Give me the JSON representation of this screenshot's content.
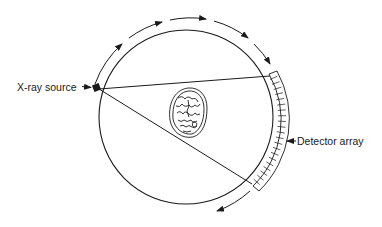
{
  "diagram": {
    "type": "CT scanner geometry (fan-beam)",
    "labels": {
      "source": "X-ray source",
      "detector": "Detector array"
    },
    "components": [
      {
        "id": "gantry-circle",
        "description": "circular scan field / gantry"
      },
      {
        "id": "xray-source",
        "description": "X-ray source on gantry, left"
      },
      {
        "id": "detector-array",
        "description": "curved segmented detector array, right"
      },
      {
        "id": "fan-beam",
        "description": "two lines from source to detector ends"
      },
      {
        "id": "patient-head",
        "description": "cross-section of head at center"
      },
      {
        "id": "rotation-arrows",
        "description": "clockwise rotation arrows around gantry"
      }
    ],
    "rotation_direction": "clockwise",
    "colors": {
      "line": "#1a1a1a",
      "background": "#ffffff"
    }
  }
}
